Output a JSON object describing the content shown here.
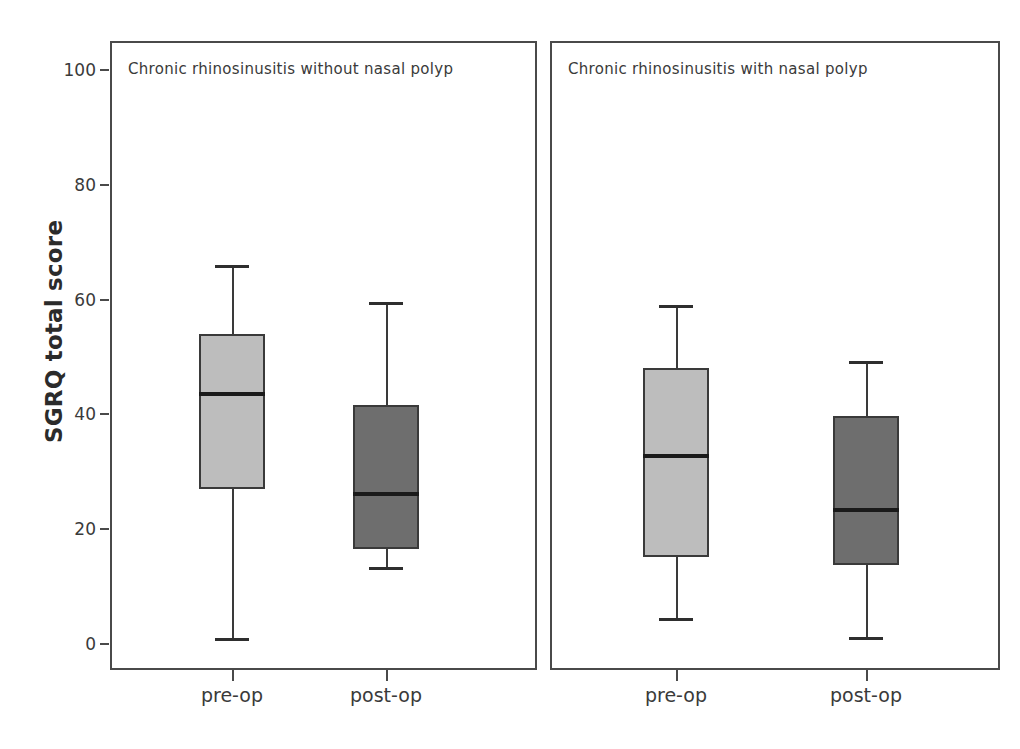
{
  "chart_data": {
    "type": "box",
    "title": "",
    "xlabel": "",
    "ylabel": "SGRQ total score",
    "ylim": [
      0,
      100
    ],
    "yticks": [
      0,
      20,
      40,
      60,
      80,
      100
    ],
    "ytick_labels": [
      "0",
      "20",
      "40",
      "60",
      "80",
      "100"
    ],
    "grid": false,
    "legend": "none",
    "panels": [
      {
        "title": "Chronic rhinosinusitis without nasal polyp",
        "categories": [
          "pre-op",
          "post-op"
        ],
        "boxes": [
          {
            "label": "pre-op",
            "fill": "#bdbdbd",
            "min": 1.0,
            "q1": 27.0,
            "median": 43.5,
            "q3": 54.0,
            "max": 66.0
          },
          {
            "label": "post-op",
            "fill": "#6e6e6e",
            "min": 13.5,
            "q1": 16.5,
            "median": 26.2,
            "q3": 41.7,
            "max": 59.6
          }
        ]
      },
      {
        "title": "Chronic rhinosinusitis with nasal polyp",
        "categories": [
          "pre-op",
          "post-op"
        ],
        "boxes": [
          {
            "label": "pre-op",
            "fill": "#bdbdbd",
            "min": 4.5,
            "q1": 15.2,
            "median": 32.8,
            "q3": 48.0,
            "max": 59.0
          },
          {
            "label": "post-op",
            "fill": "#6e6e6e",
            "min": 1.2,
            "q1": 13.7,
            "median": 23.3,
            "q3": 39.7,
            "max": 49.3
          }
        ]
      }
    ]
  },
  "axis": {
    "y_title": "SGRQ total score",
    "y_ticks": [
      "100",
      "80",
      "60",
      "40",
      "20",
      "0"
    ]
  },
  "panels": {
    "left": {
      "title": "Chronic rhinosinusitis without nasal polyp",
      "x_labels": [
        "pre-op",
        "post-op"
      ]
    },
    "right": {
      "title": "Chronic rhinosinusitis with nasal polyp",
      "x_labels": [
        "pre-op",
        "post-op"
      ]
    }
  },
  "colors": {
    "box_light": "#bdbdbd",
    "box_dark": "#6e6e6e",
    "line": "#3a3a3a",
    "frame": "#4a4a4a"
  }
}
